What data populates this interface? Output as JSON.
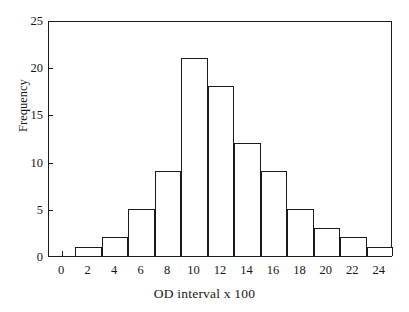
{
  "chart_data": {
    "type": "bar",
    "title": "",
    "subtitle": "",
    "xlabel": "OD interval x 100",
    "ylabel": "Frequency",
    "xlim": [
      -1,
      25
    ],
    "ylim": [
      0,
      25
    ],
    "xticks": [
      0,
      2,
      4,
      6,
      8,
      10,
      12,
      14,
      16,
      18,
      20,
      22,
      24
    ],
    "xtick_labels": [
      "0",
      "2",
      "4",
      "6",
      "8",
      "10",
      "12",
      "14",
      "16",
      "18",
      "20",
      "22",
      "24"
    ],
    "yticks": [
      0,
      5,
      10,
      15,
      20,
      25
    ],
    "ytick_labels": [
      "0",
      "5",
      "10",
      "15",
      "20",
      "25"
    ],
    "grid": false,
    "legend": null,
    "bin_width": 2,
    "bin_edges": [
      1,
      3,
      5,
      7,
      9,
      11,
      13,
      15,
      17,
      19,
      21,
      23,
      25
    ],
    "categories": [
      "1-3",
      "3-5",
      "5-7",
      "7-9",
      "9-11",
      "11-13",
      "13-15",
      "15-17",
      "17-19",
      "19-21",
      "21-23",
      "23-25"
    ],
    "bin_centers": [
      2,
      4,
      6,
      8,
      10,
      12,
      14,
      16,
      18,
      20,
      22,
      24
    ],
    "values": [
      1,
      2,
      5,
      9,
      21,
      18,
      12,
      9,
      5,
      3,
      2,
      1
    ],
    "bars": [
      {
        "left": 1,
        "right": 3,
        "value": 1
      },
      {
        "left": 3,
        "right": 5,
        "value": 2
      },
      {
        "left": 5,
        "right": 7,
        "value": 5
      },
      {
        "left": 7,
        "right": 9,
        "value": 9
      },
      {
        "left": 9,
        "right": 11,
        "value": 21
      },
      {
        "left": 11,
        "right": 13,
        "value": 18
      },
      {
        "left": 13,
        "right": 15,
        "value": 12
      },
      {
        "left": 15,
        "right": 17,
        "value": 9
      },
      {
        "left": 17,
        "right": 19,
        "value": 5
      },
      {
        "left": 19,
        "right": 21,
        "value": 3
      },
      {
        "left": 21,
        "right": 23,
        "value": 2
      },
      {
        "left": 23,
        "right": 25,
        "value": 1
      }
    ],
    "total_count": 88,
    "colors": {
      "bar_fill": "#ffffff",
      "bar_edge": "#1a1a1a",
      "axis": "#1a1a1a",
      "text": "#161616",
      "background": "#ffffff"
    }
  }
}
